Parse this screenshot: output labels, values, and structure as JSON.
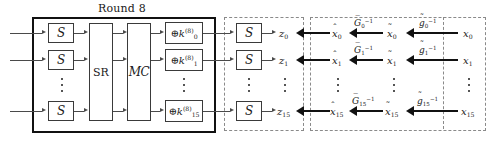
{
  "figure": {
    "type": "block-diagram",
    "domain": "cryptography-cipher-round",
    "round_title": "Round 8"
  },
  "round_block": {
    "title": "Round 8",
    "sbox_label": "S",
    "sbox_rows": [
      "S",
      "S",
      "S"
    ],
    "shiftrows_label": "SR",
    "mixcolumns_label": "MC",
    "key_add": [
      {
        "op": "⊕",
        "base": "k",
        "sub": "0",
        "sup": "(8)"
      },
      {
        "op": "⊕",
        "base": "k",
        "sub": "1",
        "sup": "(8)"
      },
      {
        "op": "⊕",
        "base": "k",
        "sub": "15",
        "sup": "(8)"
      }
    ]
  },
  "output_block": {
    "sbox_label": "S",
    "sbox_rows": [
      "S",
      "S",
      "S"
    ],
    "outputs": [
      {
        "base": "z",
        "sub": "0"
      },
      {
        "base": "z",
        "sub": "1"
      },
      {
        "base": "z",
        "sub": "15"
      }
    ]
  },
  "inverse_block": {
    "hat_x": [
      {
        "base": "x",
        "sub": "0",
        "accent": "ˆ"
      },
      {
        "base": "x",
        "sub": "1",
        "accent": "ˆ"
      },
      {
        "base": "x",
        "sub": "15",
        "accent": "ˆ"
      }
    ],
    "G_inverse": [
      {
        "base": "G",
        "sub": "0",
        "sup": "−1",
        "accent": "bar"
      },
      {
        "base": "G",
        "sub": "1",
        "sup": "−1",
        "accent": "bar"
      },
      {
        "base": "G",
        "sub": "15",
        "sup": "−1",
        "accent": "bar"
      }
    ],
    "tilde_x": [
      {
        "base": "x",
        "sub": "0",
        "accent": "˜"
      },
      {
        "base": "x",
        "sub": "1",
        "accent": "˜"
      },
      {
        "base": "x",
        "sub": "15",
        "accent": "˜"
      }
    ],
    "g_inverse": [
      {
        "base": "g",
        "sub": "0",
        "sup": "−1",
        "accent": "˜"
      },
      {
        "base": "g",
        "sub": "1",
        "sup": "−1",
        "accent": "˜"
      },
      {
        "base": "g",
        "sub": "15",
        "sup": "−1",
        "accent": "˜"
      }
    ],
    "inputs": [
      {
        "base": "x",
        "sub": "0"
      },
      {
        "base": "x",
        "sub": "1"
      },
      {
        "base": "x",
        "sub": "15"
      }
    ]
  },
  "ellipsis": {
    "glyph": "⋮",
    "count": 7
  },
  "colors": {
    "solid_border": "#111111",
    "dashed_border": "#8a8a8a",
    "component_border": "#3a3a3a",
    "thin_wire": "#4a4a4a",
    "bold_arrow": "#111111",
    "text": "#1a1a1a",
    "background": "#ffffff"
  }
}
